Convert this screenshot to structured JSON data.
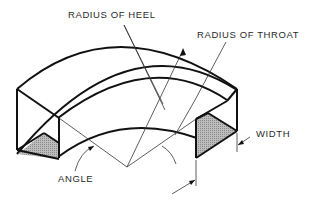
{
  "diagram": {
    "labels": {
      "radius_of_heel": "RADIUS OF HEEL",
      "radius_of_throat": "RADIUS OF THROAT",
      "width": "WIDTH",
      "angle": "ANGLE"
    },
    "colors": {
      "line": "#111111",
      "leader": "#333333",
      "hatch_fill": "#a8a8a8",
      "background": "#ffffff"
    }
  }
}
